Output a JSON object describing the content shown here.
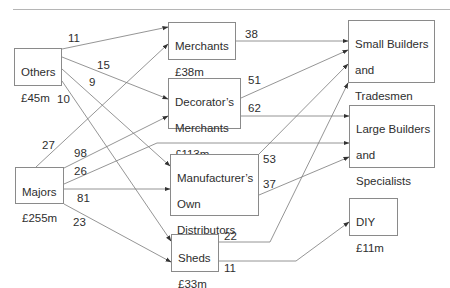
{
  "nodes": {
    "others": {
      "line1": "Others",
      "line2": "£45m"
    },
    "majors": {
      "line1": "Majors",
      "line2": "£255m"
    },
    "merchants": {
      "line1": "Merchants",
      "line2": "£38m"
    },
    "decorators": {
      "line1": "Decorator’s",
      "line2": "Merchants",
      "line3": "£113m"
    },
    "manufacturers": {
      "line1": "Manufacturer’s",
      "line2": "Own",
      "line3": "Distributors",
      "line4": "£90m"
    },
    "sheds": {
      "line1": "Sheds",
      "line2": "£33m"
    },
    "small_builders": {
      "line1": "Small Builders",
      "line2": "and",
      "line3": "Tradesmen",
      "line4": "£164m"
    },
    "large_builders": {
      "line1": "Large Builders",
      "line2": "and",
      "line3": "Specialists",
      "line4": "£125m"
    },
    "diy": {
      "line1": "DIY",
      "line2": "£11m"
    }
  },
  "flows": {
    "others_merchants": "11",
    "others_decorators": "15",
    "others_manufacturers": "9",
    "others_sheds": "10",
    "majors_merchants": "27",
    "majors_decorators": "98",
    "majors_large": "26",
    "majors_manufacturers": "81",
    "majors_sheds": "23",
    "merchants_small": "38",
    "decorators_small": "51",
    "decorators_large": "62",
    "manufacturers_small": "53",
    "manufacturers_large": "37",
    "sheds_small": "22",
    "sheds_diy": "11"
  },
  "colors": {
    "line": "#7a7a7a",
    "box_border": "#8a8a8a",
    "text": "#2e2e2e"
  }
}
